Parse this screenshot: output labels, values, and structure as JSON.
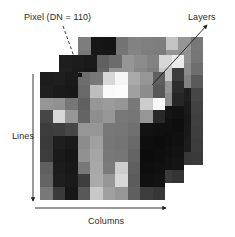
{
  "figure": {
    "type": "raster-data-structure-diagram"
  },
  "labels": {
    "pixel": "Pixel (DN = 110)",
    "layers": "Layers",
    "lines": "Lines",
    "columns": "Columns"
  },
  "annotations": {
    "pixel_leader": {
      "name": "dashed-leader-line",
      "style": "dashed",
      "from": [
        62,
        26
      ],
      "to": [
        80,
        74
      ]
    },
    "layers_leader": {
      "name": "arrow-leader-line",
      "style": "solid-arrow",
      "from": [
        152,
        84
      ],
      "to": [
        205,
        26
      ]
    },
    "lines_axis": {
      "name": "lines-axis-arrow",
      "orientation": "vertical",
      "from": [
        33,
        76
      ],
      "to": [
        33,
        202
      ]
    },
    "columns_axis": {
      "name": "columns-axis-arrow",
      "orientation": "horizontal",
      "from": [
        36,
        208
      ],
      "to": [
        166,
        208
      ]
    }
  },
  "colors": {
    "background": "#ffffff",
    "text": "#2b2b2b",
    "line": "#231f20",
    "marker": "#111111"
  },
  "chart_data": {
    "type": "heatmap",
    "xlabel": "Columns",
    "ylabel": "Lines",
    "grid": false,
    "legend": "none",
    "colormap": "grayscale",
    "vmin": 0,
    "vmax": 255,
    "highlighted_pixel": {
      "layer": 0,
      "row": 0,
      "col": 3,
      "value": 110
    },
    "layers": [
      {
        "name": "front",
        "rows": 10,
        "cols": 10,
        "values": [
          [
            28,
            30,
            26,
            110,
            120,
            215,
            245,
            170,
            150,
            95
          ],
          [
            30,
            26,
            24,
            105,
            190,
            250,
            252,
            160,
            140,
            88
          ],
          [
            150,
            145,
            118,
            96,
            150,
            155,
            150,
            120,
            205,
            248
          ],
          [
            70,
            215,
            150,
            100,
            142,
            150,
            120,
            118,
            150,
            40
          ],
          [
            60,
            62,
            70,
            150,
            150,
            120,
            118,
            112,
            18,
            16
          ],
          [
            58,
            30,
            26,
            140,
            160,
            118,
            116,
            105,
            14,
            12
          ],
          [
            60,
            26,
            22,
            145,
            165,
            120,
            118,
            100,
            12,
            14
          ],
          [
            95,
            28,
            24,
            120,
            168,
            122,
            205,
            95,
            14,
            16
          ],
          [
            100,
            30,
            26,
            62,
            170,
            150,
            215,
            92,
            16,
            18
          ],
          [
            120,
            58,
            22,
            88,
            200,
            160,
            150,
            95,
            60,
            55
          ]
        ]
      },
      {
        "name": "middle",
        "rows": 10,
        "cols": 10,
        "values": [
          [
            30,
            28,
            26,
            96,
            108,
            150,
            140,
            130,
            215,
            235
          ],
          [
            32,
            26,
            24,
            100,
            148,
            150,
            135,
            125,
            200,
            60
          ],
          [
            130,
            140,
            112,
            98,
            140,
            145,
            140,
            115,
            150,
            45
          ],
          [
            72,
            180,
            140,
            100,
            136,
            142,
            118,
            112,
            140,
            38
          ],
          [
            62,
            60,
            68,
            140,
            142,
            118,
            112,
            108,
            20,
            18
          ],
          [
            56,
            32,
            28,
            134,
            150,
            114,
            110,
            100,
            16,
            14
          ],
          [
            58,
            28,
            24,
            138,
            155,
            116,
            112,
            98,
            14,
            16
          ],
          [
            92,
            30,
            26,
            118,
            158,
            118,
            190,
            92,
            16,
            18
          ],
          [
            98,
            32,
            28,
            60,
            160,
            142,
            200,
            90,
            18,
            20
          ],
          [
            115,
            56,
            24,
            85,
            188,
            150,
            142,
            92,
            58,
            52
          ]
        ]
      },
      {
        "name": "back",
        "rows": 10,
        "cols": 10,
        "values": [
          [
            125,
            22,
            20,
            115,
            130,
            128,
            126,
            195,
            150,
            120
          ],
          [
            120,
            24,
            22,
            118,
            132,
            126,
            124,
            150,
            145,
            118
          ],
          [
            118,
            112,
            106,
            96,
            128,
            130,
            126,
            112,
            140,
            110
          ],
          [
            70,
            150,
            130,
            98,
            126,
            132,
            116,
            110,
            130,
            90
          ],
          [
            60,
            58,
            66,
            130,
            132,
            116,
            110,
            106,
            30,
            70
          ],
          [
            54,
            30,
            26,
            126,
            140,
            112,
            108,
            98,
            26,
            66
          ],
          [
            56,
            26,
            22,
            130,
            145,
            114,
            110,
            96,
            24,
            64
          ],
          [
            90,
            28,
            24,
            116,
            148,
            116,
            175,
            90,
            26,
            62
          ],
          [
            96,
            30,
            26,
            58,
            150,
            138,
            185,
            88,
            28,
            60
          ],
          [
            110,
            54,
            22,
            82,
            175,
            145,
            138,
            90,
            56,
            58
          ]
        ]
      }
    ]
  }
}
